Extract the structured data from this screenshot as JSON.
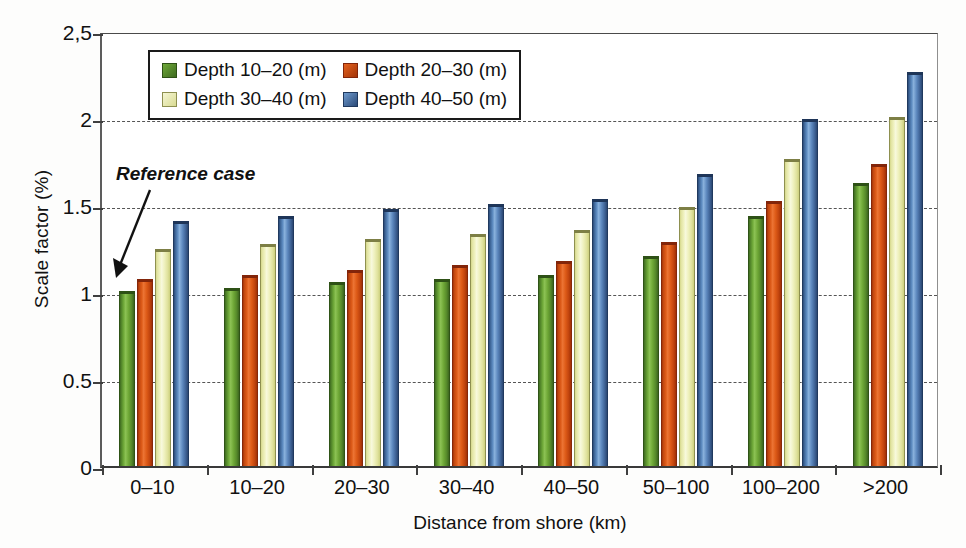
{
  "chart_data": {
    "type": "bar",
    "title": "",
    "xlabel": "Distance from shore (km)",
    "ylabel": "Scale factor (%)",
    "categories": [
      "0–10",
      "10–20",
      "20–30",
      "30–40",
      "40–50",
      "50–100",
      "100–200",
      ">200"
    ],
    "series": [
      {
        "name": "Depth 10–20 (m)",
        "color": "#6fa939",
        "values": [
          1.0,
          1.02,
          1.05,
          1.07,
          1.09,
          1.2,
          1.43,
          1.62
        ]
      },
      {
        "name": "Depth 20–30 (m)",
        "color": "#dc5a18",
        "values": [
          1.07,
          1.09,
          1.12,
          1.15,
          1.17,
          1.28,
          1.52,
          1.73
        ]
      },
      {
        "name": "Depth 30–40 (m)",
        "color": "#eff1be",
        "values": [
          1.24,
          1.27,
          1.3,
          1.33,
          1.35,
          1.48,
          1.76,
          2.0
        ]
      },
      {
        "name": "Depth 40–50 (m)",
        "color": "#5d8bc0",
        "values": [
          1.4,
          1.43,
          1.47,
          1.5,
          1.53,
          1.67,
          1.99,
          2.26
        ]
      }
    ],
    "ylim": [
      0,
      2.5
    ],
    "yticks": [
      0,
      0.5,
      1,
      1.5,
      2,
      2.5
    ],
    "ytick_labels": [
      "0",
      "0.5",
      "1",
      "1.5",
      "2",
      "2,5"
    ],
    "gridlines": [
      0.5,
      1,
      1.5,
      2
    ],
    "grid": "horizontal-dashed",
    "legend_position": "top-center-inside",
    "annotations": [
      {
        "text": "Reference case",
        "target_series": "Depth 10–20 (m)",
        "target_category": "0–10",
        "style": "bold-italic-with-arrow"
      }
    ]
  },
  "axes": {
    "ylabel": "Scale factor (%)",
    "xlabel": "Distance from shore (km)"
  },
  "legend": {
    "items": [
      {
        "label": "Depth 10–20 (m)"
      },
      {
        "label": "Depth 20–30 (m)"
      },
      {
        "label": "Depth 30–40 (m)"
      },
      {
        "label": "Depth 40–50 (m)"
      }
    ]
  },
  "annotation": {
    "reference_case": "Reference case"
  }
}
